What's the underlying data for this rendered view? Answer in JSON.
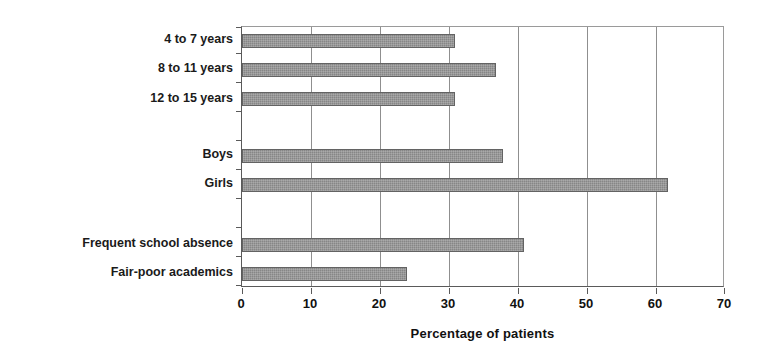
{
  "chart_data": {
    "type": "bar",
    "orientation": "horizontal",
    "title": "",
    "xlabel": "Percentage of patients",
    "ylabel": "",
    "xlim": [
      0,
      70
    ],
    "xticks": [
      0,
      10,
      20,
      30,
      40,
      50,
      60,
      70
    ],
    "xtick_labels": [
      "0",
      "10",
      "20",
      "30",
      "40",
      "50",
      "60",
      "70"
    ],
    "grid": "vertical",
    "legend": "none",
    "bar_color": "#8d8d8d",
    "bar_border_color": "#636363",
    "categories": [
      "4 to 7 years",
      "8 to 11 years",
      "12 to 15 years",
      "",
      "Boys",
      "Girls",
      "",
      "",
      "Frequent school absence",
      "Fair-poor academics"
    ],
    "values": [
      31,
      37,
      31,
      null,
      38,
      62,
      null,
      null,
      41,
      24
    ],
    "bars": [
      {
        "label": "4 to 7 years",
        "value": 31
      },
      {
        "label": "8 to 11 years",
        "value": 37
      },
      {
        "label": "12 to 15 years",
        "value": 31
      },
      {
        "label": "",
        "value": null
      },
      {
        "label": "Boys",
        "value": 38
      },
      {
        "label": "Girls",
        "value": 62
      },
      {
        "label": "",
        "value": null
      },
      {
        "label": "",
        "value": null
      },
      {
        "label": "Frequent school absence",
        "value": 41
      },
      {
        "label": "Fair-poor academics",
        "value": 24
      }
    ]
  }
}
